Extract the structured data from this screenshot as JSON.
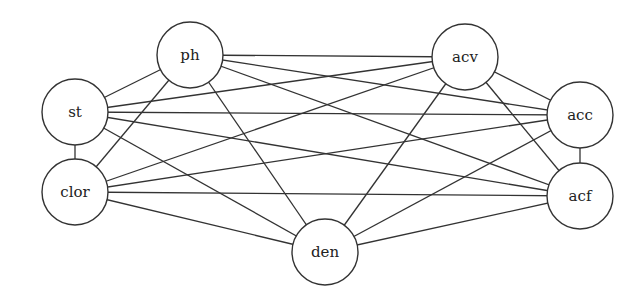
{
  "diagram": {
    "type": "undirected-graph",
    "node_radius": 33,
    "nodes": [
      {
        "id": "st",
        "label": "st",
        "x": 75,
        "y": 112
      },
      {
        "id": "clor",
        "label": "clor",
        "x": 75,
        "y": 192
      },
      {
        "id": "ph",
        "label": "ph",
        "x": 190,
        "y": 55
      },
      {
        "id": "acv",
        "label": "acv",
        "x": 465,
        "y": 57
      },
      {
        "id": "acc",
        "label": "acc",
        "x": 580,
        "y": 115
      },
      {
        "id": "acf",
        "label": "acf",
        "x": 580,
        "y": 196
      },
      {
        "id": "den",
        "label": "den",
        "x": 325,
        "y": 252
      }
    ],
    "edges": [
      [
        "st",
        "ph"
      ],
      [
        "st",
        "clor"
      ],
      [
        "st",
        "acv"
      ],
      [
        "st",
        "acc"
      ],
      [
        "st",
        "acf"
      ],
      [
        "st",
        "den"
      ],
      [
        "clor",
        "ph"
      ],
      [
        "clor",
        "acv"
      ],
      [
        "clor",
        "acc"
      ],
      [
        "clor",
        "acf"
      ],
      [
        "clor",
        "den"
      ],
      [
        "ph",
        "acv"
      ],
      [
        "ph",
        "acc"
      ],
      [
        "ph",
        "acf"
      ],
      [
        "ph",
        "den"
      ],
      [
        "acv",
        "acc"
      ],
      [
        "acv",
        "acf"
      ],
      [
        "acv",
        "den"
      ],
      [
        "acc",
        "acf"
      ],
      [
        "acc",
        "den"
      ],
      [
        "acf",
        "den"
      ]
    ],
    "colors": {
      "stroke": "#333333",
      "fill": "#ffffff",
      "text": "#222222"
    }
  }
}
